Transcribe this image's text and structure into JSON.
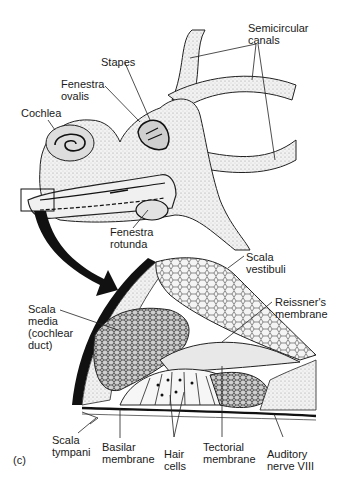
{
  "figure": {
    "panel_label": "(c)",
    "top_view": {
      "labels": {
        "semicircular_canals": "Semicircular\ncanals",
        "stapes": "Stapes",
        "fenestra_ovalis": "Fenestra\novalis",
        "cochlea": "Cochlea",
        "fenestra_rotunda": "Fenestra\nrotunda"
      }
    },
    "cross_section": {
      "labels": {
        "scala_vestibuli": "Scala\nvestibuli",
        "reissners_membrane": "Reissner's\nmembrane",
        "scala_media": "Scala\nmedia\n(cochlear\nduct)",
        "scala_tympani": "Scala\ntympani",
        "basilar_membrane": "Basilar\nmembrane",
        "hair_cells": "Hair\ncells",
        "tectorial_membrane": "Tectorial\nmembrane",
        "auditory_nerve": "Auditory\nnerve VIII"
      }
    }
  },
  "colors": {
    "ink": "#1a1a1a",
    "fill": "#e6e6e6",
    "fill_dark": "#9a9a9a",
    "background": "#ffffff"
  }
}
